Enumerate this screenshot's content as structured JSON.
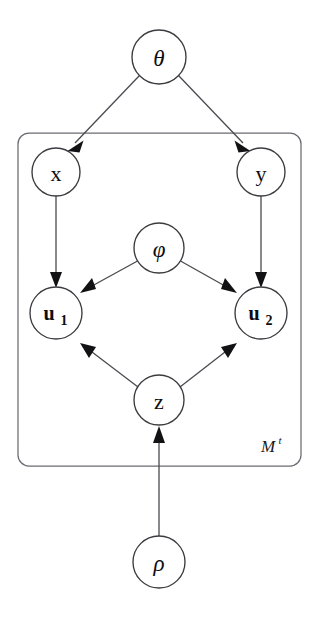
{
  "figure": {
    "type": "probabilistic-graphical-model",
    "kind": "bayesian-network-plate-diagram",
    "background_color": "#ffffff",
    "node_stroke_color": "#3b3b40",
    "edge_color": "#4a4a50",
    "arrow_color": "#121214",
    "plate_stroke_color": "#6b6b72",
    "label_color": "#0d0d10"
  },
  "nodes": [
    {
      "id": "theta",
      "label": "θ",
      "style": "greek-italic",
      "cx": 159,
      "cy": 57,
      "r": 27,
      "inside_plate": false
    },
    {
      "id": "x",
      "label": "x",
      "style": "roman",
      "cx": 56,
      "cy": 172,
      "r": 24,
      "inside_plate": true
    },
    {
      "id": "y",
      "label": "y",
      "style": "roman",
      "cx": 261,
      "cy": 172,
      "r": 24,
      "inside_plate": true
    },
    {
      "id": "phi",
      "label": "φ",
      "style": "greek-italic",
      "cx": 159,
      "cy": 248,
      "r": 25,
      "inside_plate": true
    },
    {
      "id": "u1",
      "label": "u",
      "subscript": "1",
      "style": "bold-subscript",
      "cx": 56,
      "cy": 313,
      "r": 26,
      "inside_plate": true
    },
    {
      "id": "u2",
      "label": "u",
      "subscript": "2",
      "style": "bold-subscript",
      "cx": 261,
      "cy": 313,
      "r": 26,
      "inside_plate": true
    },
    {
      "id": "z",
      "label": "z",
      "style": "roman",
      "cx": 159,
      "cy": 400,
      "r": 25,
      "inside_plate": true
    },
    {
      "id": "rho",
      "label": "ρ",
      "style": "greek-italic",
      "cx": 159,
      "cy": 562,
      "r": 26,
      "inside_plate": false
    }
  ],
  "edges": [
    {
      "from": "theta",
      "to": "x",
      "directed": true
    },
    {
      "from": "theta",
      "to": "y",
      "directed": true
    },
    {
      "from": "x",
      "to": "u1",
      "directed": true
    },
    {
      "from": "y",
      "to": "u2",
      "directed": true
    },
    {
      "from": "phi",
      "to": "u1",
      "directed": true
    },
    {
      "from": "phi",
      "to": "u2",
      "directed": true
    },
    {
      "from": "z",
      "to": "u1",
      "directed": true
    },
    {
      "from": "z",
      "to": "u2",
      "directed": true
    },
    {
      "from": "rho",
      "to": "z",
      "directed": true
    }
  ],
  "plate": {
    "id": "plate-M",
    "x": 18,
    "y": 133,
    "width": 283,
    "height": 333,
    "corner_radius": 11,
    "label_main": "M",
    "label_superscript": "t",
    "label_x": 268,
    "label_y": 452
  }
}
